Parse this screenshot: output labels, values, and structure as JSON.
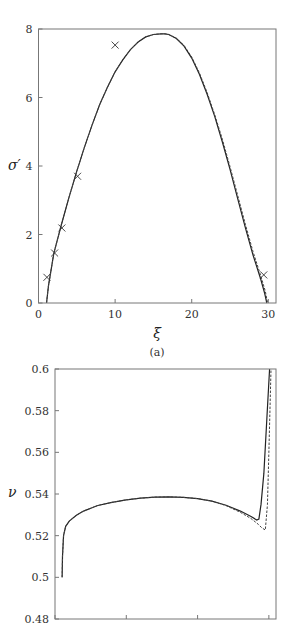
{
  "chart_data": [
    {
      "type": "line",
      "panel_label": "(a)",
      "title": "",
      "xlabel": "ξ",
      "ylabel": "σ′",
      "xlim": [
        0,
        31
      ],
      "ylim": [
        0,
        8
      ],
      "xticks": [
        0,
        10,
        20,
        30
      ],
      "yticks": [
        0,
        2,
        4,
        6,
        8
      ],
      "grid": false,
      "legend": null,
      "series": [
        {
          "name": "solid",
          "style": "solid",
          "x": [
            1.05,
            1.3,
            2.0,
            3.0,
            4.0,
            5.0,
            6.0,
            7.0,
            8.0,
            9.0,
            10.0,
            11.0,
            12.0,
            13.0,
            14.0,
            15.0,
            16.0,
            16.5,
            17.0,
            18.0,
            19.0,
            20.0,
            21.0,
            22.0,
            23.0,
            24.0,
            25.0,
            26.0,
            27.0,
            28.0,
            29.0,
            29.5,
            29.8
          ],
          "y": [
            0.0,
            0.5,
            1.45,
            2.3,
            3.1,
            3.85,
            4.55,
            5.2,
            5.8,
            6.3,
            6.75,
            7.1,
            7.4,
            7.62,
            7.77,
            7.84,
            7.86,
            7.86,
            7.84,
            7.72,
            7.5,
            7.15,
            6.68,
            6.1,
            5.45,
            4.7,
            3.9,
            3.05,
            2.2,
            1.4,
            0.7,
            0.3,
            0.0
          ]
        },
        {
          "name": "dashed",
          "style": "dashed",
          "x": [
            1.05,
            1.3,
            2.0,
            3.0,
            4.0,
            5.0,
            6.0,
            7.0,
            8.0,
            9.0,
            10.0,
            11.0,
            12.0,
            13.0,
            14.0,
            15.0,
            16.0,
            16.5,
            17.0,
            18.0,
            19.0,
            20.0,
            21.0,
            22.0,
            23.0,
            24.0,
            25.0,
            26.0,
            27.0,
            28.0,
            29.0,
            29.6,
            29.9
          ],
          "y": [
            0.0,
            0.5,
            1.45,
            2.3,
            3.1,
            3.85,
            4.55,
            5.2,
            5.8,
            6.3,
            6.75,
            7.1,
            7.4,
            7.62,
            7.77,
            7.84,
            7.86,
            7.86,
            7.84,
            7.73,
            7.52,
            7.18,
            6.72,
            6.15,
            5.5,
            4.78,
            3.98,
            3.14,
            2.3,
            1.5,
            0.8,
            0.35,
            0.0
          ]
        },
        {
          "name": "data points",
          "style": "x-marker",
          "x": [
            1.1,
            2.1,
            3.05,
            5.1,
            10.0,
            29.4
          ],
          "y": [
            0.75,
            1.46,
            2.19,
            3.7,
            7.53,
            0.82
          ]
        }
      ]
    },
    {
      "type": "line",
      "panel_label": "",
      "title": "",
      "xlabel": "",
      "ylabel": "ν",
      "xlim": [
        0,
        31
      ],
      "ylim": [
        0.48,
        0.6
      ],
      "xticks": [
        0,
        10,
        20,
        30
      ],
      "xtick_labels": [
        "",
        "",
        "",
        ""
      ],
      "yticks": [
        0.48,
        0.5,
        0.52,
        0.54,
        0.56,
        0.58,
        0.6
      ],
      "ytick_labels": [
        "0.48",
        "0.5",
        "0.52",
        "0.54",
        "0.56",
        "0.58",
        "0.6"
      ],
      "grid": false,
      "legend": null,
      "series": [
        {
          "name": "solid",
          "style": "solid",
          "x": [
            1.0,
            1.05,
            1.2,
            1.5,
            2.0,
            3.0,
            4.0,
            6.0,
            8.0,
            10.0,
            12.0,
            14.0,
            16.0,
            18.0,
            20.0,
            22.0,
            24.0,
            26.0,
            27.5,
            28.3,
            28.6,
            28.9,
            29.3,
            29.7,
            30.1
          ],
          "y": [
            0.5,
            0.51,
            0.52,
            0.5245,
            0.527,
            0.5298,
            0.5318,
            0.5345,
            0.536,
            0.5372,
            0.538,
            0.5385,
            0.5386,
            0.5384,
            0.5378,
            0.5366,
            0.5346,
            0.5318,
            0.5292,
            0.5275,
            0.528,
            0.535,
            0.55,
            0.575,
            0.6
          ]
        },
        {
          "name": "dashed",
          "style": "dashed",
          "x": [
            1.0,
            1.05,
            1.2,
            1.5,
            2.0,
            3.0,
            4.0,
            6.0,
            8.0,
            10.0,
            12.0,
            14.0,
            16.0,
            18.0,
            20.0,
            22.0,
            24.0,
            26.0,
            27.5,
            28.5,
            29.0,
            29.5,
            29.8,
            30.0,
            30.3
          ],
          "y": [
            0.5,
            0.51,
            0.52,
            0.5245,
            0.527,
            0.5298,
            0.5318,
            0.5345,
            0.536,
            0.5372,
            0.538,
            0.5385,
            0.5386,
            0.5384,
            0.5378,
            0.5366,
            0.5344,
            0.5312,
            0.5282,
            0.5255,
            0.5238,
            0.5227,
            0.535,
            0.56,
            0.6
          ]
        }
      ]
    }
  ],
  "labels": {
    "panel_a_caption": "(a)"
  }
}
